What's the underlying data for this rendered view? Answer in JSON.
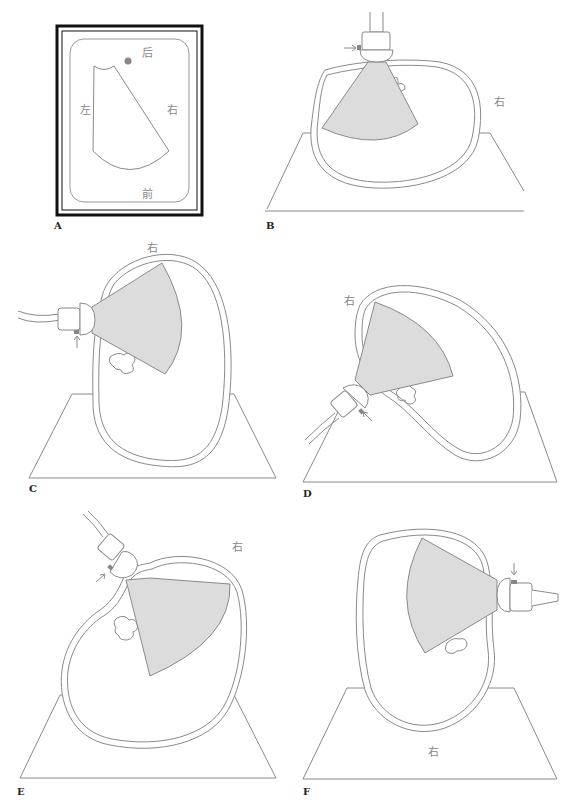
{
  "figure": {
    "panels": [
      {
        "id": "A",
        "label": "A",
        "orientation_labels": {
          "top": "后",
          "left": "左",
          "right": "右",
          "bottom": "前"
        }
      },
      {
        "id": "B",
        "label": "B",
        "side_label": "右"
      },
      {
        "id": "C",
        "label": "C",
        "side_label": "右"
      },
      {
        "id": "D",
        "label": "D",
        "side_label": "右"
      },
      {
        "id": "E",
        "label": "E",
        "side_label": "右"
      },
      {
        "id": "F",
        "label": "F",
        "side_label": "右"
      }
    ]
  },
  "colors": {
    "line": "#8a8a8a",
    "fan_fill": "#dcdcdc",
    "marker": "#888888",
    "frame": "#111111"
  }
}
